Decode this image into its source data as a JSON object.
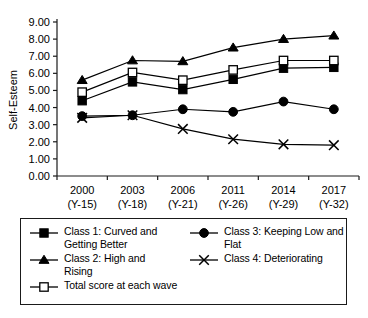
{
  "chart_data": {
    "type": "line",
    "title": "",
    "xlabel": "",
    "ylabel": "Self-Esteem",
    "ylim": [
      0,
      9
    ],
    "ytick_values": [
      0,
      1,
      2,
      3,
      4,
      5,
      6,
      7,
      8,
      9
    ],
    "ytick_labels": [
      "0.00",
      "1.00",
      "2.00",
      "3.00",
      "4.00",
      "5.00",
      "6.00",
      "7.00",
      "8.00",
      "9.00"
    ],
    "categories": [
      "2000",
      "2003",
      "2006",
      "2011",
      "2014",
      "2017"
    ],
    "category_sublabels": [
      "(Y-15)",
      "(Y-18)",
      "(Y-21)",
      "(Y-26)",
      "(Y-29)",
      "(Y-32)"
    ],
    "grid": false,
    "legend_position": "bottom",
    "series": [
      {
        "name": "Class 1: Curved and Getting Better",
        "marker": "filled-square",
        "values": [
          4.4,
          5.5,
          5.05,
          5.65,
          6.3,
          6.35
        ]
      },
      {
        "name": "Class 2: High and Rising",
        "marker": "filled-triangle",
        "values": [
          5.6,
          6.75,
          6.7,
          7.5,
          8.0,
          8.2
        ]
      },
      {
        "name": "Class 3: Keeping Low and Flat",
        "marker": "filled-circle",
        "values": [
          3.5,
          3.55,
          3.9,
          3.75,
          4.35,
          3.9
        ]
      },
      {
        "name": "Class 4: Deteriorating",
        "marker": "cross-x",
        "values": [
          3.4,
          3.55,
          2.75,
          2.15,
          1.85,
          1.8
        ]
      },
      {
        "name": "Total score at each wave",
        "marker": "open-square",
        "values": [
          4.9,
          6.05,
          5.6,
          6.2,
          6.75,
          6.75
        ]
      }
    ]
  },
  "axis": {
    "y_title": "Self-Esteem"
  },
  "legend": {
    "entries": [
      {
        "label": "Class 1: Curved and\nGetting Better",
        "marker": "filled-square"
      },
      {
        "label": "Class 2: High and\nRising",
        "marker": "filled-triangle"
      },
      {
        "label": "Total score at each wave",
        "marker": "open-square"
      },
      {
        "label": "Class 3: Keeping Low and\nFlat",
        "marker": "filled-circle"
      },
      {
        "label": "Class 4: Deteriorating",
        "marker": "cross-x"
      }
    ]
  },
  "colors": {
    "line": "#000000",
    "marker": "#000000",
    "axis": "#1a1a1a",
    "background": "#ffffff"
  }
}
